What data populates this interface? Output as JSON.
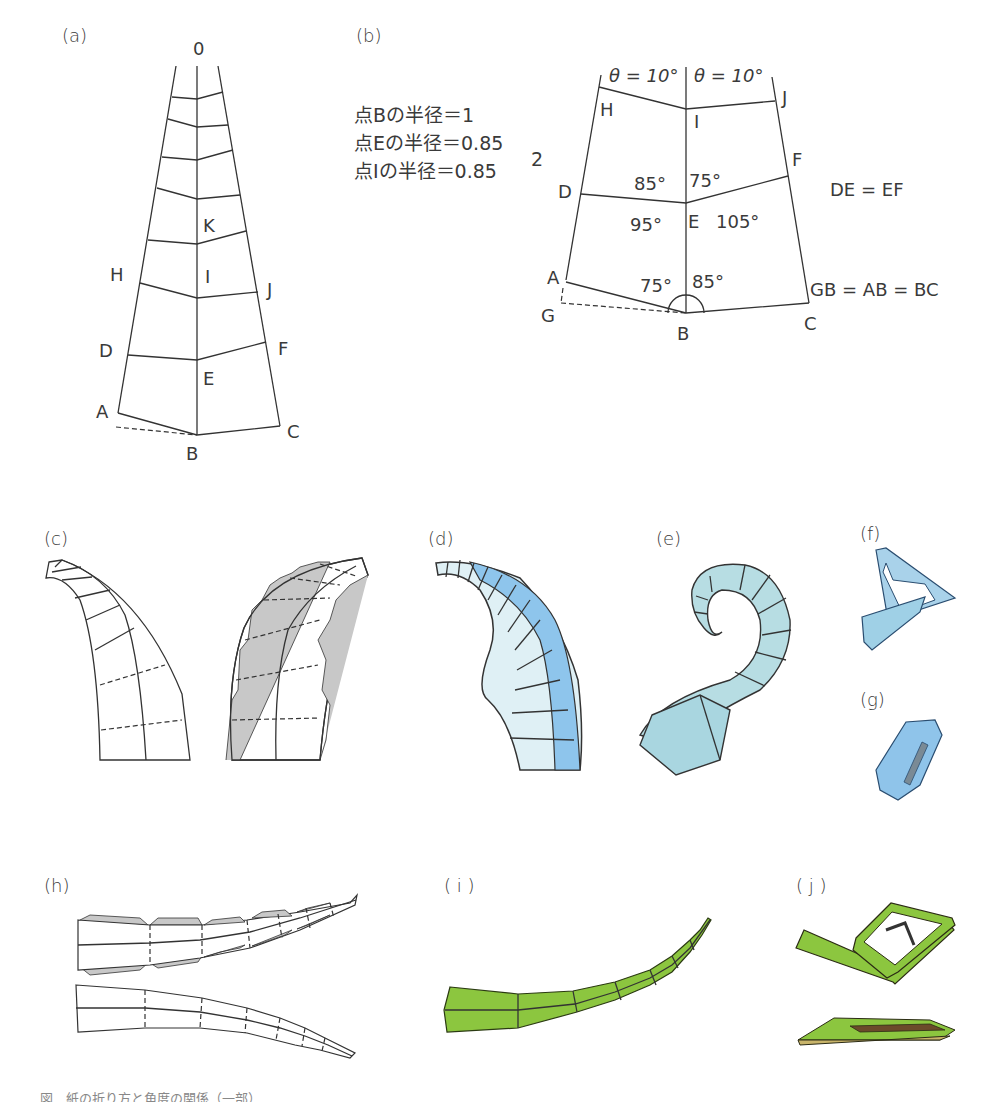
{
  "panels": {
    "a": {
      "label": "(a)",
      "apex": "0",
      "points": {
        "A": "A",
        "B": "B",
        "C": "C",
        "D": "D",
        "E": "E",
        "F": "F",
        "H": "H",
        "I": "I",
        "J": "J",
        "K": "K"
      }
    },
    "b": {
      "label": "(b)",
      "notes": [
        "点Bの半径＝1",
        "点Eの半径＝0.85",
        "点Iの半径＝0.85"
      ],
      "note_superscript": "2",
      "theta_left": "θ = 10°",
      "theta_right": "θ = 10°",
      "angles": {
        "DE_top": "85°",
        "EF_top": "75°",
        "DE_bottom": "95°",
        "EF_bottom": "105°",
        "AB_top": "75°",
        "BC_top": "85°"
      },
      "equalities": {
        "de_ef": "DE = EF",
        "gb_ab_bc": "GB = AB = BC"
      },
      "points": {
        "A": "A",
        "B": "B",
        "C": "C",
        "D": "D",
        "E": "E",
        "F": "F",
        "G": "G",
        "H": "H",
        "I": "I",
        "J": "J"
      }
    },
    "c": {
      "label": "(c)"
    },
    "d": {
      "label": "(d)"
    },
    "e": {
      "label": "(e)"
    },
    "f": {
      "label": "(f)"
    },
    "g": {
      "label": "(g)"
    },
    "h": {
      "label": "(h)"
    },
    "i": {
      "label": "( i )"
    },
    "j": {
      "label": "( j )"
    }
  },
  "colors": {
    "line": "#333333",
    "gray_fill": "#c8c8c8",
    "blue_light": "#dff0f5",
    "blue_mid": "#a8d4ec",
    "blue_dark": "#6eb0e0",
    "teal": "#b7dde3",
    "green": "#8cc63f",
    "green_dark": "#6aa22a"
  },
  "caption": "図　紙の折り方と角度の関係（一部）"
}
